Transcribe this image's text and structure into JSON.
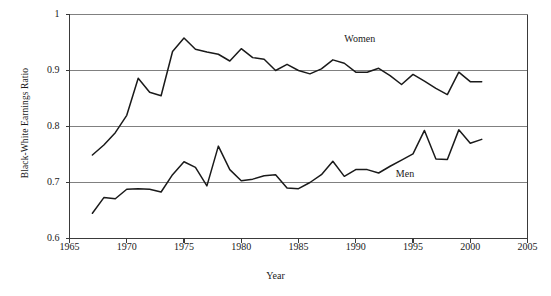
{
  "chart_data": {
    "type": "line",
    "title": "",
    "xlabel": "Year",
    "ylabel": "Black-White Earnings Ratio",
    "xlim": [
      1965,
      2005
    ],
    "ylim": [
      0.6,
      1.0
    ],
    "xticks": [
      "1965",
      "1970",
      "1975",
      "1980",
      "1985",
      "1990",
      "1995",
      "2000",
      "2005"
    ],
    "xtick_values": [
      1965,
      1970,
      1975,
      1980,
      1985,
      1990,
      1995,
      2000,
      2005
    ],
    "yticks": [
      "0.6",
      "0.7",
      "0.8",
      "0.9",
      "1"
    ],
    "ytick_values": [
      0.6,
      0.7,
      0.8,
      0.9,
      1.0
    ],
    "grid": "horizontal",
    "legend_position": "inline-annotation",
    "line_color": "#1a1a1a",
    "grid_color": "#808080",
    "axis_color": "#555555",
    "annotations": [
      {
        "text": "Women",
        "x": 1989.0,
        "y": 0.955
      },
      {
        "text": "Men",
        "x": 1993.5,
        "y": 0.714
      }
    ],
    "x": [
      1967,
      1968,
      1969,
      1970,
      1971,
      1972,
      1973,
      1974,
      1975,
      1976,
      1977,
      1978,
      1979,
      1980,
      1981,
      1982,
      1983,
      1984,
      1985,
      1986,
      1987,
      1988,
      1989,
      1990,
      1991,
      1992,
      1993,
      1994,
      1995,
      1996,
      1997,
      1998,
      1999,
      2000,
      2001
    ],
    "series": [
      {
        "name": "Women",
        "values": [
          0.749,
          0.767,
          0.789,
          0.82,
          0.886,
          0.861,
          0.855,
          0.934,
          0.958,
          0.938,
          0.933,
          0.929,
          0.917,
          0.939,
          0.923,
          0.92,
          0.9,
          0.911,
          0.9,
          0.894,
          0.903,
          0.919,
          0.913,
          0.897,
          0.897,
          0.904,
          0.891,
          0.875,
          0.893,
          0.881,
          0.868,
          0.857,
          0.897,
          0.88,
          0.88
        ]
      },
      {
        "name": "Men",
        "values": [
          0.645,
          0.673,
          0.671,
          0.688,
          0.689,
          0.688,
          0.683,
          0.714,
          0.737,
          0.727,
          0.694,
          0.765,
          0.723,
          0.703,
          0.706,
          0.712,
          0.714,
          0.69,
          0.689,
          0.7,
          0.714,
          0.738,
          0.711,
          0.723,
          0.723,
          0.717,
          0.729,
          0.74,
          0.751,
          0.793,
          0.742,
          0.741,
          0.794,
          0.77,
          0.777
        ]
      }
    ]
  }
}
